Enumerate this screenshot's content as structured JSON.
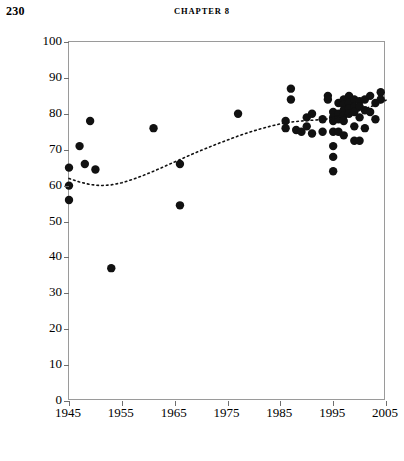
{
  "page": {
    "folio": "230",
    "chapter_header": "CHAPTER 8"
  },
  "chart_data": {
    "type": "scatter",
    "title": "",
    "xlabel": "",
    "ylabel": "Support (%)",
    "xlim": [
      1945,
      2005
    ],
    "ylim": [
      0,
      100
    ],
    "xticks": [
      1945,
      1955,
      1965,
      1975,
      1985,
      1995,
      2005
    ],
    "yticks": [
      0,
      10,
      20,
      30,
      40,
      50,
      60,
      70,
      80,
      90,
      100
    ],
    "xtick_labels": [
      "1945",
      "1955",
      "1965",
      "1975",
      "1985",
      "1995",
      "2005"
    ],
    "ytick_labels": [
      "0",
      "10",
      "20",
      "30",
      "40",
      "50",
      "60",
      "70",
      "80",
      "90",
      "100"
    ],
    "grid": false,
    "legend": "none",
    "marker": {
      "shape": "circle",
      "color": "#111111",
      "size": 4.2
    },
    "series": [
      {
        "name": "Support",
        "type": "scatter",
        "points": [
          [
            1945,
            65.0
          ],
          [
            1945,
            60.0
          ],
          [
            1945,
            56.0
          ],
          [
            1947,
            71.0
          ],
          [
            1948,
            66.0
          ],
          [
            1949,
            78.0
          ],
          [
            1950,
            64.5
          ],
          [
            1953,
            37.0
          ],
          [
            1961,
            76.0
          ],
          [
            1966,
            66.0
          ],
          [
            1966,
            54.5
          ],
          [
            1977,
            80.0
          ],
          [
            1986,
            78.0
          ],
          [
            1986,
            76.0
          ],
          [
            1987,
            84.0
          ],
          [
            1987,
            87.0
          ],
          [
            1988,
            75.5
          ],
          [
            1989,
            75.0
          ],
          [
            1990,
            79.0
          ],
          [
            1990,
            76.5
          ],
          [
            1991,
            80.0
          ],
          [
            1991,
            74.5
          ],
          [
            1993,
            78.5
          ],
          [
            1993,
            75.0
          ],
          [
            1994,
            85.0
          ],
          [
            1994,
            84.0
          ],
          [
            1995,
            80.5
          ],
          [
            1995,
            79.0
          ],
          [
            1995,
            78.0
          ],
          [
            1995,
            75.0
          ],
          [
            1995,
            71.0
          ],
          [
            1995,
            68.0
          ],
          [
            1995,
            64.0
          ],
          [
            1996,
            83.0
          ],
          [
            1996,
            80.0
          ],
          [
            1996,
            78.5
          ],
          [
            1996,
            75.0
          ],
          [
            1997,
            84.0
          ],
          [
            1997,
            82.5
          ],
          [
            1997,
            81.0
          ],
          [
            1997,
            79.5
          ],
          [
            1997,
            78.0
          ],
          [
            1997,
            74.0
          ],
          [
            1998,
            85.0
          ],
          [
            1998,
            83.0
          ],
          [
            1998,
            81.5
          ],
          [
            1998,
            80.0
          ],
          [
            1999,
            84.0
          ],
          [
            1999,
            82.0
          ],
          [
            1999,
            80.5
          ],
          [
            1999,
            76.5
          ],
          [
            1999,
            72.5
          ],
          [
            2000,
            83.5
          ],
          [
            2000,
            82.0
          ],
          [
            2000,
            79.0
          ],
          [
            2000,
            72.5
          ],
          [
            2001,
            84.0
          ],
          [
            2001,
            81.0
          ],
          [
            2001,
            76.0
          ],
          [
            2002,
            85.0
          ],
          [
            2002,
            80.5
          ],
          [
            2003,
            83.0
          ],
          [
            2003,
            78.5
          ],
          [
            2004,
            86.0
          ],
          [
            2004,
            84.0
          ]
        ]
      },
      {
        "name": "Loess trend",
        "type": "line",
        "style": "dotted",
        "points": [
          [
            1945,
            62.0
          ],
          [
            1947,
            61.0
          ],
          [
            1949,
            60.3
          ],
          [
            1951,
            60.0
          ],
          [
            1953,
            60.2
          ],
          [
            1955,
            60.8
          ],
          [
            1957,
            61.7
          ],
          [
            1959,
            62.8
          ],
          [
            1961,
            64.0
          ],
          [
            1963,
            65.3
          ],
          [
            1965,
            66.6
          ],
          [
            1967,
            67.9
          ],
          [
            1969,
            69.2
          ],
          [
            1971,
            70.4
          ],
          [
            1973,
            71.6
          ],
          [
            1975,
            72.7
          ],
          [
            1977,
            73.8
          ],
          [
            1979,
            74.8
          ],
          [
            1981,
            75.7
          ],
          [
            1983,
            76.5
          ],
          [
            1985,
            77.2
          ],
          [
            1987,
            77.7
          ],
          [
            1989,
            78.0
          ],
          [
            1991,
            78.2
          ],
          [
            1993,
            78.4
          ],
          [
            1995,
            78.8
          ],
          [
            1997,
            79.5
          ],
          [
            1999,
            80.4
          ],
          [
            2001,
            81.4
          ],
          [
            2003,
            82.5
          ],
          [
            2005,
            83.8
          ]
        ]
      }
    ]
  }
}
